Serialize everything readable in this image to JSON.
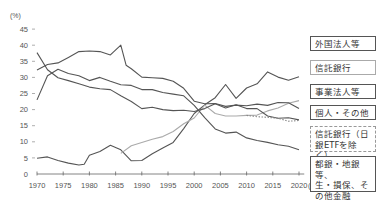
{
  "chart_data": {
    "type": "line",
    "title": "",
    "xlabel": "(年度)",
    "ylabel": "(%)",
    "ylim": [
      0,
      45
    ],
    "xlim": [
      1970,
      2021
    ],
    "yticks": [
      0,
      5,
      10,
      15,
      20,
      25,
      30,
      35,
      40,
      45
    ],
    "xticks": [
      1970,
      1975,
      1980,
      1985,
      1990,
      1995,
      2000,
      2005,
      2010,
      2015,
      2020
    ],
    "grid": false,
    "legend_position": "right",
    "series": [
      {
        "name": "外国法人等",
        "style": "solid",
        "color": "#555555",
        "x": [
          1970,
          1972,
          1974,
          1976,
          1978,
          1979,
          1980,
          1982,
          1984,
          1986,
          1988,
          1990,
          1992,
          1994,
          1996,
          1998,
          2000,
          2002,
          2004,
          2006,
          2008,
          2010,
          2012,
          2014,
          2016,
          2018,
          2020
        ],
        "values": [
          4.9,
          5.3,
          4.2,
          3.4,
          2.8,
          3.0,
          5.8,
          7.0,
          8.9,
          7.5,
          4.1,
          4.2,
          6.3,
          8.1,
          9.8,
          14.1,
          18.8,
          21.5,
          23.7,
          27.8,
          23.5,
          26.7,
          28.0,
          31.7,
          30.1,
          29.1,
          30.2
        ]
      },
      {
        "name": "信託銀行",
        "style": "solid",
        "color": "#aaaaaa",
        "x": [
          1986,
          1988,
          1990,
          1992,
          1994,
          1996,
          1998,
          2000,
          2002,
          2004,
          2006,
          2008,
          2010,
          2012,
          2014,
          2016,
          2018,
          2020
        ],
        "values": [
          6.4,
          8.8,
          9.8,
          10.8,
          11.6,
          13.2,
          15.6,
          17.4,
          21.4,
          18.8,
          18.0,
          18.0,
          18.2,
          18.3,
          19.6,
          20.5,
          22.0,
          22.8
        ]
      },
      {
        "name": "事業法人等",
        "style": "solid",
        "color": "#555555",
        "x": [
          1970,
          1972,
          1974,
          1976,
          1978,
          1980,
          1982,
          1984,
          1986,
          1987,
          1988,
          1990,
          1992,
          1994,
          1996,
          1998,
          2000,
          2002,
          2004,
          2006,
          2008,
          2010,
          2012,
          2014,
          2016,
          2018,
          2020
        ],
        "values": [
          32.3,
          34.0,
          34.5,
          36.2,
          38.0,
          38.2,
          38.0,
          37.0,
          40.0,
          33.8,
          32.7,
          30.1,
          29.9,
          29.7,
          28.8,
          26.6,
          22.6,
          21.8,
          21.9,
          21.0,
          21.4,
          21.2,
          21.7,
          21.3,
          22.2,
          22.1,
          20.3
        ]
      },
      {
        "name": "個人・その他",
        "style": "solid",
        "color": "#555555",
        "x": [
          1970,
          1972,
          1974,
          1976,
          1978,
          1980,
          1982,
          1984,
          1986,
          1988,
          1990,
          1992,
          1994,
          1996,
          1998,
          2000,
          2002,
          2004,
          2006,
          2008,
          2010,
          2012,
          2014,
          2016,
          2018,
          2020
        ],
        "values": [
          37.7,
          32.4,
          29.9,
          29.0,
          28.0,
          27.0,
          26.5,
          26.2,
          24.3,
          22.5,
          20.3,
          20.7,
          20.0,
          19.7,
          19.8,
          19.4,
          20.3,
          21.8,
          20.5,
          21.5,
          20.3,
          20.3,
          18.0,
          17.3,
          17.5,
          16.8
        ]
      },
      {
        "name": "信託銀行(日銀ETFを除く)",
        "style": "dotted",
        "color": "#888888",
        "x": [
          2010,
          2012,
          2014,
          2016,
          2018,
          2020
        ],
        "values": [
          18.2,
          17.8,
          17.6,
          17.3,
          16.4,
          16.6
        ]
      },
      {
        "name": "都銀・地銀等、生・損保、その他金融",
        "style": "solid",
        "color": "#555555",
        "x": [
          1970,
          1972,
          1974,
          1976,
          1978,
          1980,
          1982,
          1984,
          1986,
          1988,
          1990,
          1992,
          1994,
          1996,
          1998,
          2000,
          2002,
          2004,
          2006,
          2008,
          2010,
          2012,
          2014,
          2016,
          2018,
          2020
        ],
        "values": [
          23.0,
          30.5,
          32.5,
          31.2,
          30.5,
          29.0,
          30.0,
          28.8,
          27.7,
          27.5,
          26.2,
          26.2,
          25.3,
          24.8,
          24.3,
          21.3,
          17.5,
          14.0,
          12.7,
          13.0,
          11.2,
          10.4,
          9.8,
          9.1,
          8.6,
          7.5
        ]
      }
    ]
  },
  "axis": {
    "y_unit": "(%)",
    "x_unit": "(年度)",
    "y_ticks": [
      "0",
      "5",
      "10",
      "15",
      "20",
      "25",
      "30",
      "35",
      "40",
      "45"
    ],
    "x_ticks": [
      "1970",
      "1975",
      "1980",
      "1985",
      "1990",
      "1995",
      "2000",
      "2005",
      "2010",
      "2015",
      "2020"
    ]
  },
  "legend": {
    "foreign": "外国法人等",
    "trust": "信託銀行",
    "business": "事業法人等",
    "individual": "個人・その他",
    "trust_ex_boj_1": "信託銀行（日",
    "trust_ex_boj_2": "銀ETFを除く）",
    "banks_1": "都銀・地銀等、",
    "banks_2": "生・損保、そ",
    "banks_3": "の他金融"
  }
}
